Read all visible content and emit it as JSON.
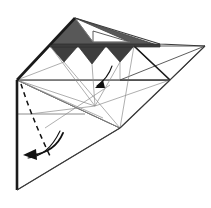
{
  "figure": {
    "title": "Origami folding diagram step",
    "kind": "origami-step-diagram",
    "canvas": {
      "width": 211,
      "height": 208,
      "background": "#ffffff"
    },
    "palette": {
      "paper_front": "#ffffff",
      "paper_back_shade": "#585858",
      "paper_back_shade_dark": "#3e3e3e",
      "crease_line": "#8d8d8d",
      "edge_line": "#3a3a3a",
      "bold_edge": "#1a1a1a",
      "fold_dashed": "#111111",
      "arrow": "#111111"
    },
    "elements": {
      "shaded_band_label": "shaded back-side band",
      "zigzag_label": "sawtooth pleated edge",
      "white_top_flap_label": "white top triangular flap",
      "right_flap_label": "right downward triangular flap",
      "left_apex_label": "left corner apex",
      "dashed_fold_label": "valley fold line",
      "main_arrow_label": "large fold-over arrow",
      "small_arrow_label": "small fold arrow"
    },
    "zigzag": {
      "teeth_count": 3,
      "baseline_y": 46,
      "tooth_depth": 16,
      "start_x": 50,
      "end_x": 134
    },
    "points": {
      "top_apex": [
        75,
        18
      ],
      "left_apex": [
        17,
        80
      ],
      "bottom_left": [
        17,
        190
      ],
      "bottom_right_diag": [
        120,
        128
      ],
      "right_edge": [
        205,
        46
      ],
      "right_flap_tip": [
        170,
        80
      ],
      "mid_line_y": 80,
      "second_line_y": 114
    }
  }
}
